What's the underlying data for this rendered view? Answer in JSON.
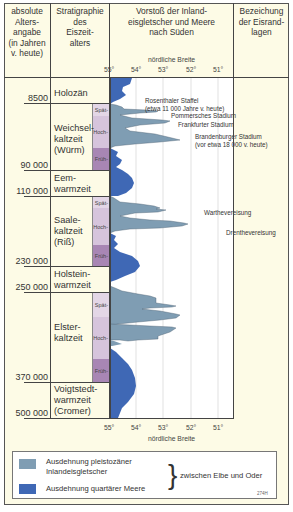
{
  "header": {
    "age_col": [
      "absolute",
      "Alters-",
      "angabe",
      "(in Jahren",
      "v. heute)"
    ],
    "strat_col": [
      "Stratigraphie",
      "des",
      "Eiszeit-",
      "alters"
    ],
    "chart_col": [
      "Vorstoß der Inland-",
      "eisgletscher und Meere",
      "nach Süden"
    ],
    "name_col": [
      "Bezeichung",
      "der Eisrand-",
      "lagen"
    ],
    "axis_title": "nördliche Breite"
  },
  "axis": {
    "ticks": [
      "55°",
      "54°",
      "53°",
      "52°",
      "51°"
    ],
    "title_bottom": "nördliche Breite"
  },
  "ages": [
    "8500",
    "90 000",
    "110 000",
    "230 000",
    "250 000",
    "370 000",
    "500 000"
  ],
  "stages": [
    {
      "lines": [
        "Holozän"
      ]
    },
    {
      "lines": [
        "Weichsel-",
        "kaltzeit",
        "(Würm)"
      ]
    },
    {
      "lines": [
        "Eem-",
        "warmzeit"
      ]
    },
    {
      "lines": [
        "Saale-",
        "kaltzeit",
        "(Riß)"
      ]
    },
    {
      "lines": [
        "Holstein-",
        "warmzeit"
      ]
    },
    {
      "lines": [
        "Elster-",
        "kaltzeit"
      ]
    },
    {
      "lines": [
        "Voigtstedt-",
        "warmzeit",
        "(Cromer)"
      ]
    }
  ],
  "subphases": {
    "spaet": "Spät-",
    "hoch": "Hoch-",
    "frueh": "Früh-"
  },
  "ice_margins": {
    "rosenthal": [
      "Rosenthaler Staffel",
      "(etwa 11 000 Jahre v. heute)"
    ],
    "pommern": "Pommersches Stadium",
    "frankfurt": "Frankfurter Stadium",
    "brandenburg": [
      "Brandenburger Stadium",
      "(vor etwa 18 000 v. heute)"
    ],
    "warthe": "Warthevereisung",
    "drenthe": "Drenthevereisung"
  },
  "legend": {
    "ice": [
      "Ausdehnung pleistozäner",
      "Inlandeisgletscher"
    ],
    "sea": "Ausdehnung quartärer Meere",
    "region": "zwischen Elbe und Oder",
    "code": "274H"
  },
  "colors": {
    "ice": "#7f9db3",
    "sea": "#3f68b5",
    "background": "#fdfbe6",
    "subphase_light": "#d8c6de",
    "subphase_dark": "#a785b3"
  }
}
